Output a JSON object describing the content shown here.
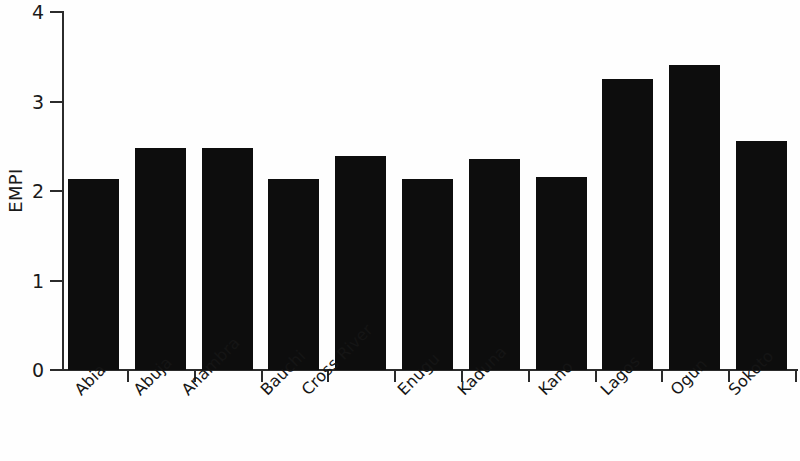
{
  "chart_data": {
    "type": "bar",
    "title": "",
    "subtitle": "",
    "xlabel": "",
    "ylabel": "EMPI",
    "categories": [
      "Abia",
      "Abuja",
      "Anambra",
      "Bauchi",
      "Cross River",
      "Enugu",
      "Kaduna",
      "Kano",
      "Lagos",
      "Ogun",
      "Sokoto"
    ],
    "values": [
      2.13,
      2.48,
      2.48,
      2.13,
      2.39,
      2.13,
      2.36,
      2.16,
      3.25,
      3.41,
      2.56
    ],
    "ylim": [
      0,
      4
    ],
    "y_ticks": [
      0,
      1,
      2,
      3,
      4
    ],
    "y_tick_labels": [
      "0",
      "1",
      "2",
      "3",
      "4"
    ],
    "grid": false,
    "legend": false,
    "legend_position": "none",
    "bar_color": "#0d0d0d",
    "axis_color": "#2b2b2b",
    "background_color": "#fefefe",
    "x_label_rotation": -45
  }
}
